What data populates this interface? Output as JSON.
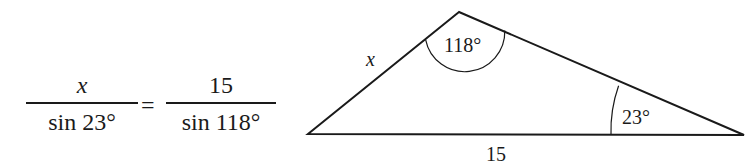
{
  "equation": {
    "left_numerator": "x",
    "left_denominator": "sin 23°",
    "equals": "=",
    "right_numerator": "15",
    "right_denominator": "sin 118°"
  },
  "triangle": {
    "vertices": {
      "top": [
        459,
        12
      ],
      "bottom_left": [
        308,
        134
      ],
      "bottom_right": [
        744,
        135
      ]
    },
    "side_labels": {
      "left_side": "x",
      "base": "15"
    },
    "angle_labels": {
      "top_angle": "118°",
      "right_angle": "23°"
    },
    "stroke_color": "#1a1a1a"
  }
}
